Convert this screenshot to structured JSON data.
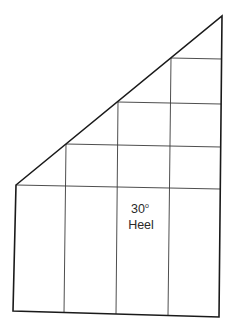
{
  "diagram": {
    "label": {
      "angle": "30",
      "degree_symbol": "o",
      "caption": "Heel"
    },
    "grid": {
      "columns": 4,
      "rows_at_right": 6,
      "rows_at_left": 1
    }
  }
}
